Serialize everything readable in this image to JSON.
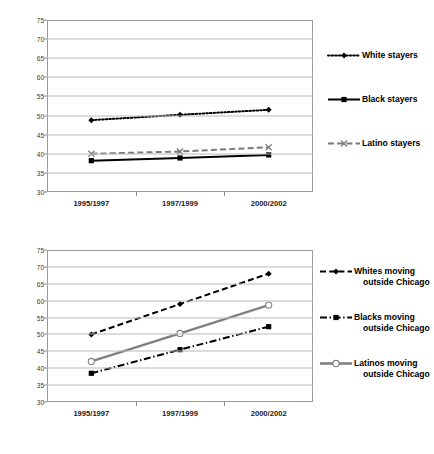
{
  "page": {
    "background": "#ffffff",
    "artifact_mark": "·  ·"
  },
  "charts": [
    {
      "id": "stayers",
      "ylabel": "Median income, in thousands",
      "xticks": [
        "1995/1997",
        "1997/1999",
        "2000/2002"
      ],
      "yticks": [
        "30",
        "35",
        "40",
        "45",
        "50",
        "55",
        "60",
        "65",
        "70",
        "75"
      ],
      "legend": [
        {
          "label": "White stayers",
          "line2": "",
          "key": "dotted-diamond-key"
        },
        {
          "label": "Black stayers",
          "line2": "",
          "key": "solid-square-key"
        },
        {
          "label": "Latino stayers",
          "line2": "",
          "key": "dashed-x-key"
        }
      ]
    },
    {
      "id": "movers",
      "ylabel": "Median income, in thousands",
      "xticks": [
        "1995/1997",
        "1997/1999",
        "2000/2002"
      ],
      "yticks": [
        "30",
        "35",
        "40",
        "45",
        "50",
        "55",
        "60",
        "65",
        "70",
        "75"
      ],
      "legend": [
        {
          "label": "Whites moving",
          "line2": "outside Chicago",
          "key": "dashed-diamond-key"
        },
        {
          "label": "Blacks moving",
          "line2": "outside Chicago",
          "key": "dashdot-square-key"
        },
        {
          "label": "Latinos moving",
          "line2": "outside Chicago",
          "key": "gray-circle-key"
        }
      ]
    }
  ],
  "chart_data": [
    {
      "type": "line",
      "title": "",
      "xlabel": "",
      "ylabel": "Median income, in thousands",
      "categories": [
        "1995/1997",
        "1997/1999",
        "2000/2002"
      ],
      "ylim": [
        30,
        75
      ],
      "ytick_step": 5,
      "grid": true,
      "legend_position": "right",
      "series": [
        {
          "name": "White stayers",
          "values": [
            48.8,
            50.2,
            51.5
          ],
          "color": "#000000",
          "style": "dotted",
          "marker": "diamond"
        },
        {
          "name": "Black stayers",
          "values": [
            38.2,
            38.9,
            39.7
          ],
          "color": "#000000",
          "style": "solid",
          "marker": "square"
        },
        {
          "name": "Latino stayers",
          "values": [
            40.0,
            40.6,
            41.7
          ],
          "color": "#7a7a7a",
          "style": "dashed",
          "marker": "x"
        }
      ]
    },
    {
      "type": "line",
      "title": "",
      "xlabel": "",
      "ylabel": "Median income, in thousands",
      "categories": [
        "1995/1997",
        "1997/1999",
        "2000/2002"
      ],
      "ylim": [
        30,
        75
      ],
      "ytick_step": 5,
      "grid": true,
      "legend_position": "right",
      "series": [
        {
          "name": "Whites moving outside Chicago",
          "values": [
            50.0,
            59.0,
            68.0
          ],
          "color": "#000000",
          "style": "dashed",
          "marker": "diamond"
        },
        {
          "name": "Blacks moving outside Chicago",
          "values": [
            38.5,
            45.5,
            52.3
          ],
          "color": "#000000",
          "style": "dashdot",
          "marker": "square"
        },
        {
          "name": "Latinos moving outside Chicago",
          "values": [
            42.0,
            50.3,
            58.7
          ],
          "color": "#808080",
          "style": "solid",
          "marker": "circle-open"
        }
      ]
    }
  ]
}
